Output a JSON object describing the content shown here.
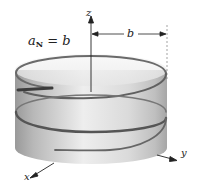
{
  "figure": {
    "equation": {
      "lhs_var": "a",
      "lhs_sub": "N",
      "op": " = ",
      "rhs": "b"
    },
    "axes": {
      "x_label": "x",
      "y_label": "y",
      "z_label": "z"
    },
    "radius_label": "b",
    "colors": {
      "cylinder_light": "#f2f2f2",
      "cylinder_dark": "#9a9a9a",
      "helix": "#555555",
      "axes": "#222222"
    }
  }
}
